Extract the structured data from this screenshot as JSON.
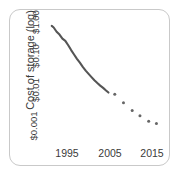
{
  "figure": {
    "frame_color": "#c9c9c9",
    "background_color": "#ffffff",
    "line_color": "#555555",
    "dot_color": "#666666",
    "text_color": "#3a3a3a"
  },
  "axes": {
    "y_title": "Cost of storage (log)",
    "y_ticks": [
      "$1.00",
      "$0.10",
      "$0.01",
      "$0.001"
    ],
    "x_ticks": [
      "1995",
      "2005",
      "2015"
    ]
  },
  "chart_data": {
    "type": "line",
    "title": "",
    "subtitle": "",
    "xlabel": "",
    "ylabel": "Cost of storage (log)",
    "xlim": [
      1991,
      2017
    ],
    "ylim": [
      0.0005,
      2.0
    ],
    "yscale": "log",
    "grid": false,
    "legend": null,
    "y_tick_values": [
      1.0,
      0.1,
      0.01,
      0.001
    ],
    "y_tick_labels": [
      "$1.00",
      "$0.10",
      "$0.01",
      "$0.001"
    ],
    "x_tick_values": [
      1995,
      2005,
      2015
    ],
    "x_tick_labels": [
      "1995",
      "2005",
      "2015"
    ],
    "series": [
      {
        "name": "Cost of storage (continuous line)",
        "style": "solid-line",
        "x": [
          1992.6,
          1993.0,
          1993.6,
          1994.2,
          1994.8,
          1995.4,
          1996.0,
          1996.6,
          1997.2,
          1997.8,
          1998.4,
          1999.0,
          1999.6,
          2000.2,
          2000.8,
          2001.4,
          2002.0,
          2002.6,
          2003.2,
          2003.8,
          2004.3
        ],
        "y": [
          1.05,
          0.95,
          0.72,
          0.6,
          0.46,
          0.4,
          0.3,
          0.22,
          0.165,
          0.125,
          0.097,
          0.074,
          0.058,
          0.047,
          0.038,
          0.031,
          0.026,
          0.022,
          0.019,
          0.016,
          0.014
        ]
      },
      {
        "name": "Cost of storage (scattered points)",
        "style": "dots",
        "x": [
          2005.6,
          2007.4,
          2009.2,
          2010.8,
          2012.6,
          2014.2
        ],
        "y": [
          0.0125,
          0.0072,
          0.0044,
          0.0031,
          0.0022,
          0.0019
        ]
      }
    ]
  }
}
